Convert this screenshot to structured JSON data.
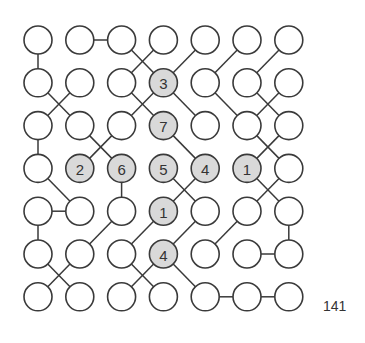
{
  "puzzle": {
    "rows": 7,
    "cols": 7,
    "puzzle_number": "141",
    "colors": {
      "clue_fill": "#d9d9d9",
      "plain_fill": "#ffffff",
      "stroke": "#3a3a3a",
      "text": "#333333"
    },
    "clues": [
      {
        "r": 1,
        "c": 3,
        "value": "3"
      },
      {
        "r": 2,
        "c": 3,
        "value": "7"
      },
      {
        "r": 3,
        "c": 1,
        "value": "2"
      },
      {
        "r": 3,
        "c": 2,
        "value": "6"
      },
      {
        "r": 3,
        "c": 3,
        "value": "5"
      },
      {
        "r": 3,
        "c": 4,
        "value": "4"
      },
      {
        "r": 3,
        "c": 5,
        "value": "1"
      },
      {
        "r": 4,
        "c": 3,
        "value": "1"
      },
      {
        "r": 5,
        "c": 3,
        "value": "4"
      }
    ],
    "edges": [
      [
        [
          0,
          0
        ],
        [
          1,
          0
        ]
      ],
      [
        [
          2,
          0
        ],
        [
          3,
          0
        ]
      ],
      [
        [
          3,
          2
        ],
        [
          4,
          2
        ]
      ],
      [
        [
          4,
          0
        ],
        [
          5,
          0
        ]
      ],
      [
        [
          4,
          6
        ],
        [
          5,
          6
        ]
      ],
      [
        [
          0,
          1
        ],
        [
          0,
          2
        ]
      ],
      [
        [
          4,
          0
        ],
        [
          4,
          1
        ]
      ],
      [
        [
          5,
          5
        ],
        [
          5,
          6
        ]
      ],
      [
        [
          6,
          4
        ],
        [
          6,
          5
        ]
      ],
      [
        [
          6,
          5
        ],
        [
          6,
          6
        ]
      ],
      [
        [
          0,
          2
        ],
        [
          1,
          3
        ]
      ],
      [
        [
          0,
          3
        ],
        [
          1,
          2
        ]
      ],
      [
        [
          0,
          4
        ],
        [
          1,
          3
        ]
      ],
      [
        [
          0,
          5
        ],
        [
          1,
          4
        ]
      ],
      [
        [
          0,
          6
        ],
        [
          1,
          5
        ]
      ],
      [
        [
          1,
          0
        ],
        [
          2,
          1
        ]
      ],
      [
        [
          1,
          1
        ],
        [
          2,
          0
        ]
      ],
      [
        [
          1,
          2
        ],
        [
          2,
          3
        ]
      ],
      [
        [
          1,
          3
        ],
        [
          2,
          2
        ]
      ],
      [
        [
          1,
          3
        ],
        [
          2,
          4
        ]
      ],
      [
        [
          1,
          4
        ],
        [
          2,
          5
        ]
      ],
      [
        [
          1,
          5
        ],
        [
          2,
          6
        ]
      ],
      [
        [
          1,
          6
        ],
        [
          2,
          5
        ]
      ],
      [
        [
          2,
          1
        ],
        [
          3,
          2
        ]
      ],
      [
        [
          2,
          2
        ],
        [
          3,
          1
        ]
      ],
      [
        [
          2,
          3
        ],
        [
          3,
          4
        ]
      ],
      [
        [
          2,
          5
        ],
        [
          3,
          6
        ]
      ],
      [
        [
          2,
          6
        ],
        [
          3,
          5
        ]
      ],
      [
        [
          3,
          0
        ],
        [
          4,
          1
        ]
      ],
      [
        [
          3,
          3
        ],
        [
          4,
          4
        ]
      ],
      [
        [
          3,
          4
        ],
        [
          4,
          3
        ]
      ],
      [
        [
          3,
          5
        ],
        [
          4,
          6
        ]
      ],
      [
        [
          3,
          6
        ],
        [
          4,
          5
        ]
      ],
      [
        [
          4,
          2
        ],
        [
          5,
          1
        ]
      ],
      [
        [
          4,
          3
        ],
        [
          5,
          2
        ]
      ],
      [
        [
          4,
          4
        ],
        [
          5,
          3
        ]
      ],
      [
        [
          4,
          5
        ],
        [
          5,
          4
        ]
      ],
      [
        [
          5,
          0
        ],
        [
          6,
          1
        ]
      ],
      [
        [
          5,
          1
        ],
        [
          6,
          0
        ]
      ],
      [
        [
          5,
          2
        ],
        [
          6,
          3
        ]
      ],
      [
        [
          5,
          3
        ],
        [
          6,
          2
        ]
      ],
      [
        [
          5,
          3
        ],
        [
          6,
          4
        ]
      ]
    ]
  }
}
